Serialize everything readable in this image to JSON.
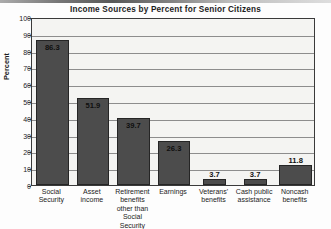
{
  "chart_data": {
    "type": "bar",
    "title": "Income Sources by Percent for Senior Citizens",
    "xlabel": "",
    "ylabel": "Percent",
    "ylim": [
      0,
      100
    ],
    "ytick_step": 10,
    "yticks": [
      0,
      10,
      20,
      30,
      40,
      50,
      60,
      70,
      80,
      90,
      100
    ],
    "grid": true,
    "legend": "none",
    "categories": [
      "Social Security",
      "Asset income",
      "Retirement benefits other than Social Security",
      "Earnings",
      "Veterans' benefits",
      "Cash public assistance",
      "Noncash benefits"
    ],
    "category_lines": [
      [
        "Social",
        "Security"
      ],
      [
        "Asset",
        "income"
      ],
      [
        "Retirement",
        "benefits",
        "other than",
        "Social Security"
      ],
      [
        "Earnings"
      ],
      [
        "Veterans'",
        "benefits"
      ],
      [
        "Cash public",
        "assistance"
      ],
      [
        "Noncash",
        "benefits"
      ]
    ],
    "values": [
      86.3,
      51.9,
      39.7,
      26.3,
      3.7,
      3.7,
      11.8
    ],
    "value_labels": [
      "86.3",
      "51.9",
      "39.7",
      "26.3",
      "3.7",
      "3.7",
      "11.8"
    ],
    "bar_color": "#4c4c4c",
    "plot_background": "#f4f4f2",
    "gridline_color": "#8d8d8d",
    "axis_color": "#3a3a3a"
  }
}
